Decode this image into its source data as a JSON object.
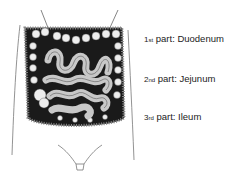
{
  "figure": {
    "colors": {
      "outline": "#555555",
      "bowel_fill": "#c8c8c8",
      "background_dark": "#1a1a1a",
      "colon_fill": "#eeeeee"
    }
  },
  "labels": [
    {
      "num": "1",
      "suffix": "st",
      "text": " part: Duodenum"
    },
    {
      "num": "2",
      "suffix": "nd",
      "text": " part: Jejunum"
    },
    {
      "num": "3",
      "suffix": "rd",
      "text": " part: Ileum"
    }
  ]
}
